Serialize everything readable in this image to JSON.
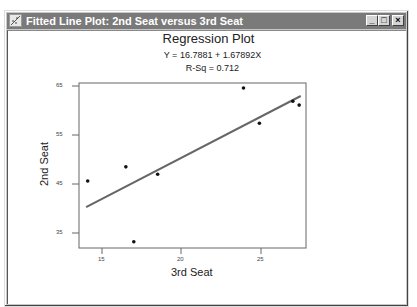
{
  "window": {
    "title": "Fitted Line Plot: 2nd Seat versus 3rd Seat",
    "icon": "fitted-line-plot-icon",
    "controls": {
      "minimize": "_",
      "maximize": "□",
      "close": "×"
    }
  },
  "plot": {
    "title": "Regression Plot",
    "equation": "Y = 16.7881 + 1.67892X",
    "rsq": "R-Sq = 0.712",
    "xlabel": "3rd Seat",
    "ylabel": "2nd Seat",
    "xticks": [
      "15",
      "20",
      "25"
    ],
    "yticks": [
      "65",
      "55",
      "45",
      "35"
    ]
  },
  "chart_data": {
    "type": "scatter",
    "title": "Regression Plot",
    "subtitle": [
      "Y = 16.7881 + 1.67892X",
      "R-Sq = 0.712"
    ],
    "xlabel": "3rd Seat",
    "ylabel": "2nd Seat",
    "xlim": [
      13.3,
      27.8
    ],
    "ylim": [
      32.0,
      65.6
    ],
    "xticks": [
      15,
      20,
      25
    ],
    "yticks": [
      35,
      45,
      55,
      65
    ],
    "grid": false,
    "legend": null,
    "series": [
      {
        "name": "Observations",
        "type": "scatter",
        "x": [
          14.1,
          16.5,
          17.0,
          18.5,
          23.9,
          24.9,
          27.0,
          27.4
        ],
        "y": [
          45.6,
          48.5,
          33.2,
          47.0,
          64.6,
          57.4,
          61.9,
          61.1
        ]
      },
      {
        "name": "Fitted line",
        "type": "line",
        "intercept": 16.7881,
        "slope": 1.67892,
        "x": [
          14.0,
          27.5
        ],
        "y": [
          40.29,
          62.96
        ]
      }
    ]
  }
}
